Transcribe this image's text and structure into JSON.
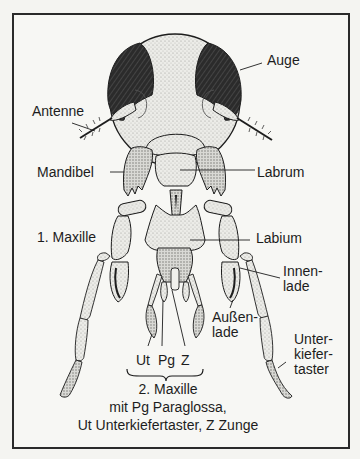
{
  "figure": {
    "labels": {
      "auge": "Auge",
      "antenne": "Antenne",
      "mandibel": "Mandibel",
      "labrum": "Labrum",
      "maxille1": "1. Maxille",
      "labium": "Labium",
      "innenlade": "Innen-\nlade",
      "aussenlade": "Außen-\nlade",
      "unterkiefertaster": "Unter-\nkiefer-\ntaster",
      "abbrev_ut": "Ut",
      "abbrev_pg": "Pg",
      "abbrev_z": "Z"
    },
    "caption": {
      "line1": "2. Maxille",
      "line2": "mit Pg Paraglossa,",
      "line3": "Ut Unterkiefertaster,   Z Zunge"
    },
    "colors": {
      "ink": "#1d1d1d",
      "eye": "#2b2b2b",
      "stipple": "#d8d8d4",
      "paper": "#f7f7f4"
    }
  }
}
